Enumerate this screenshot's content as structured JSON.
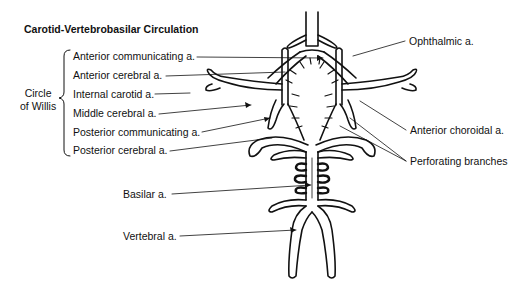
{
  "title": "Carotid-Vertebrobasilar Circulation",
  "group_label": {
    "line1": "Circle",
    "line2": "of Willis"
  },
  "left_labels": [
    "Anterior communicating a.",
    "Anterior cerebral a.",
    "Internal carotid a.",
    "Middle cerebral a.",
    "Posterior communicating a.",
    "Posterior cerebral a."
  ],
  "lower_labels": {
    "basilar": "Basilar a.",
    "vertebral": "Vertebral a."
  },
  "right_labels": {
    "ophthalmic": "Ophthalmic a.",
    "anterior_choroidal": "Anterior choroidal a.",
    "perforating": "Perforating branches"
  }
}
